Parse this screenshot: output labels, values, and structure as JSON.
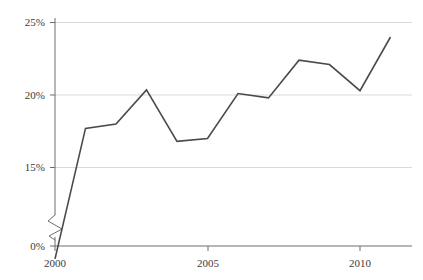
{
  "chart_data": {
    "type": "line",
    "title": "",
    "subtitle": "",
    "xlabel": "",
    "ylabel": "",
    "x": [
      2000,
      2001,
      2002,
      2003,
      2004,
      2005,
      2006,
      2007,
      2008,
      2009,
      2010,
      2011
    ],
    "values": [
      8.7,
      17.7,
      18.0,
      20.35,
      16.8,
      17.0,
      20.1,
      19.8,
      22.4,
      22.1,
      20.3,
      24.0
    ],
    "series": [
      {
        "name": "",
        "values": [
          8.7,
          17.7,
          18.0,
          20.35,
          16.8,
          17.0,
          20.1,
          19.8,
          22.4,
          22.1,
          20.3,
          24.0
        ]
      }
    ],
    "xlim": [
      2000,
      2011.7
    ],
    "ylim": [
      0,
      25.8
    ],
    "y_axis_break": true,
    "y_break_range": [
      0.6,
      12.2
    ],
    "grid": "horizontal",
    "legend": "none",
    "xtick_values": [
      2000,
      2005,
      2010
    ],
    "xtick_labels": [
      "2000",
      "2005",
      "2010"
    ],
    "xminor_tick_values": [
      2000,
      2005,
      2010
    ],
    "ytick_values": [
      0,
      15,
      20,
      25
    ],
    "ytick_labels": [
      "0%",
      "15%",
      "20%",
      "25%"
    ],
    "gridline_values": [
      15,
      20,
      25
    ],
    "annotations": [],
    "colors": {
      "line": "#4a4a4a",
      "grid": "#d9d9d9",
      "axis": "#6e6e6e",
      "baseline": "#6e6e6e",
      "text": "#3b3b3b",
      "background": "#ffffff"
    }
  }
}
